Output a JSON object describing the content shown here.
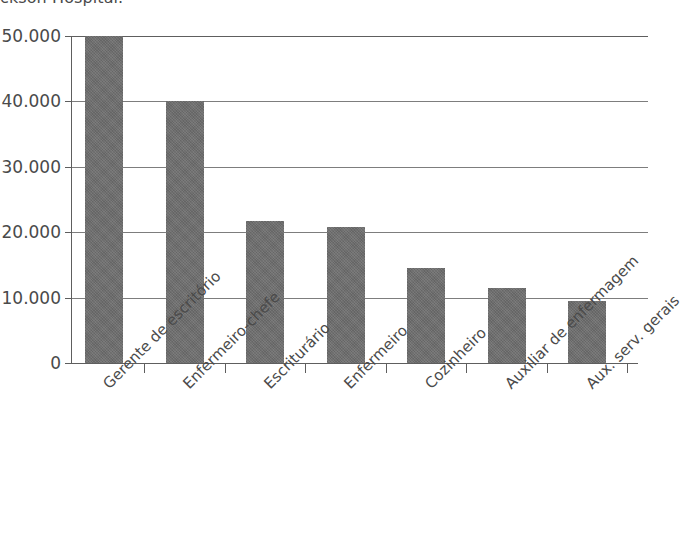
{
  "chart_data": {
    "type": "bar",
    "title": "ckson Hospital.",
    "title_note": "title cropped at top edge of screenshot",
    "xlabel": "",
    "ylabel": "",
    "categories": [
      "Gerente de escritório",
      "Enfermeiro-chefe",
      "Escriturário",
      "Enfermeiro",
      "Cozinheiro",
      "Auxiliar de enfermagem",
      "Aux. serv. gerais"
    ],
    "values": [
      50000,
      40000,
      21700,
      20800,
      14600,
      11500,
      9500
    ],
    "ylim": [
      0,
      50000
    ],
    "yticks": [
      0,
      10000,
      20000,
      30000,
      40000,
      50000
    ],
    "ytick_labels": [
      "0",
      "10.000",
      "20.000",
      "30.000",
      "40.000",
      "50.000"
    ],
    "grid": true,
    "legend": false,
    "bar_color": "#6d6d6d",
    "axis_color": "#5e5e5e",
    "grid_color": "#7d7d7d",
    "text_color": "#4a4a4a",
    "label_rotation": -45
  }
}
